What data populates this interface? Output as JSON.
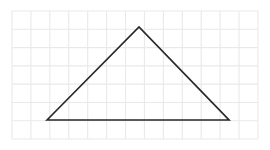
{
  "figure": {
    "title": "",
    "canvas": {
      "width": 270,
      "height": 150,
      "background": "#ffffff"
    },
    "grid": {
      "visible": true,
      "origin_x": 12,
      "origin_y": 11,
      "cell_width": 18.92,
      "cell_height": 18.29,
      "columns": 13,
      "rows": 7,
      "line_color": "#e9e9e9",
      "line_width": 1.1
    },
    "shape": {
      "name": "triangle",
      "kind": "obtuse-scalene-triangle",
      "stroke_color": "#272727",
      "stroke_width": 1.7,
      "fill": "none",
      "closed": true,
      "vertices": [
        {
          "label": "A",
          "x": 47,
          "y": 120,
          "grid_x": 1.85,
          "grid_y": 5.96
        },
        {
          "label": "B",
          "x": 139,
          "y": 27,
          "grid_x": 6.71,
          "grid_y": 0.87
        },
        {
          "label": "C",
          "x": 229,
          "y": 120,
          "grid_x": 11.47,
          "grid_y": 5.96
        }
      ],
      "edges": [
        {
          "name": "left-side",
          "from": "A",
          "to": "B"
        },
        {
          "name": "right-side",
          "from": "B",
          "to": "C"
        },
        {
          "name": "base",
          "from": "C",
          "to": "A"
        }
      ]
    }
  },
  "chart_data": {
    "type": "scatter",
    "title": "",
    "subtitle": "",
    "xlabel": "",
    "ylabel": "",
    "grid": true,
    "legend": null,
    "xlim": [
      0,
      13
    ],
    "ylim": [
      0,
      7
    ],
    "xticks": [
      0,
      1,
      2,
      3,
      4,
      5,
      6,
      7,
      8,
      9,
      10,
      11,
      12,
      13
    ],
    "yticks": [
      0,
      1,
      2,
      3,
      4,
      5,
      6,
      7
    ],
    "xticklabels": [],
    "yticklabels": [],
    "series": [
      {
        "name": "triangle",
        "type": "polygon",
        "closed": true,
        "color": "#272727",
        "x": [
          1.85,
          6.71,
          11.47
        ],
        "y": [
          1.04,
          6.13,
          1.04
        ],
        "points_px": [
          [
            47,
            120
          ],
          [
            139,
            27
          ],
          [
            229,
            120
          ]
        ]
      }
    ],
    "annotations": []
  }
}
